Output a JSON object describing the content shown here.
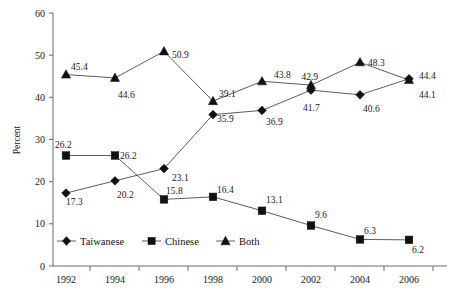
{
  "chart_data": {
    "type": "line",
    "title": "",
    "xlabel": "",
    "ylabel": "Percent",
    "categories": [
      "1992",
      "1994",
      "1996",
      "1998",
      "2000",
      "2002",
      "2004",
      "2006"
    ],
    "x": [
      1992,
      1994,
      1996,
      1998,
      2000,
      2002,
      2004,
      2006
    ],
    "ylim": [
      0,
      60
    ],
    "yticks": [
      0,
      10,
      20,
      30,
      40,
      50,
      60
    ],
    "ytick_labels": [
      "0",
      "10",
      "20",
      "30",
      "40",
      "50",
      "60"
    ],
    "grid": false,
    "legend_position": "inside-bottom-left",
    "series": [
      {
        "name": "Taiwanese",
        "marker": "diamond",
        "color": "#111111",
        "values": [
          17.3,
          20.2,
          23.1,
          35.9,
          36.9,
          41.7,
          40.6,
          44.4
        ],
        "labels": [
          "17.3",
          "20.2",
          "23.1",
          "35.9",
          "36.9",
          "41.7",
          "40.6",
          "44.4"
        ]
      },
      {
        "name": "Chinese",
        "marker": "square",
        "color": "#111111",
        "values": [
          26.2,
          26.2,
          15.8,
          16.4,
          13.1,
          9.6,
          6.3,
          6.2
        ],
        "labels": [
          "26.2",
          "26.2",
          "15.8",
          "16.4",
          "13.1",
          "9.6",
          "6.3",
          "6.2"
        ]
      },
      {
        "name": "Both",
        "marker": "triangle",
        "color": "#111111",
        "values": [
          45.4,
          44.6,
          50.9,
          39.1,
          43.8,
          42.9,
          48.3,
          44.1
        ],
        "labels": [
          "45.4",
          "44.6",
          "50.9",
          "39.1",
          "43.8",
          "42.9",
          "48.3",
          "44.1"
        ]
      }
    ]
  },
  "axis": {
    "y_title": "Percent",
    "y_labels": [
      "60",
      "50",
      "40",
      "30",
      "20",
      "10",
      "0"
    ],
    "x_labels": [
      "1992",
      "1994",
      "1996",
      "1998",
      "2000",
      "2002",
      "2004",
      "2006"
    ]
  },
  "legend": {
    "items": [
      {
        "label": "Taiwanese",
        "marker": "diamond-marker"
      },
      {
        "label": "Chinese",
        "marker": "square-marker"
      },
      {
        "label": "Both",
        "marker": "triangle-marker"
      }
    ]
  },
  "value_labels": {
    "taiwanese": [
      "17.3",
      "20.2",
      "23.1",
      "35.9",
      "36.9",
      "41.7",
      "40.6",
      "44.4"
    ],
    "chinese": [
      "26.2",
      "26.2",
      "15.8",
      "16.4",
      "13.1",
      "9.6",
      "6.3",
      "6.2"
    ],
    "both": [
      "45.4",
      "44.6",
      "50.9",
      "39.1",
      "43.8",
      "42.9",
      "48.3",
      "44.1"
    ]
  }
}
